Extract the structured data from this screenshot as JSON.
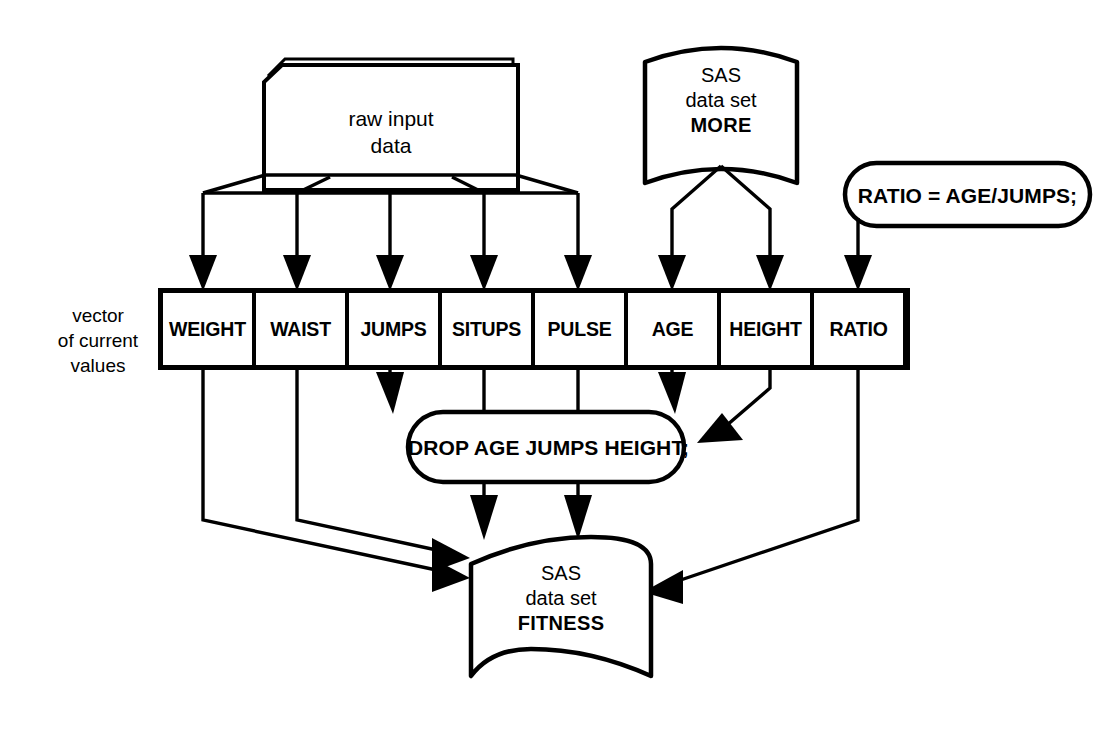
{
  "diagram": {
    "nodes": {
      "raw_input": {
        "name": "raw-input-data",
        "label_line1": "raw input",
        "label_line2": "data",
        "shape": "card-deck"
      },
      "dataset_more": {
        "name": "sas-data-set-more",
        "label_line1": "SAS",
        "label_line2": "data set",
        "label_line3": "MORE",
        "shape": "data-set"
      },
      "ratio_statement": {
        "name": "ratio-assignment-statement",
        "label": "RATIO = AGE/JUMPS;",
        "shape": "rounded-capsule"
      },
      "drop_statement": {
        "name": "drop-statement",
        "label": "DROP AGE JUMPS HEIGHT;",
        "shape": "rounded-capsule"
      },
      "dataset_fitness": {
        "name": "sas-data-set-fitness",
        "label_line1": "SAS",
        "label_line2": "data set",
        "label_line3": "FITNESS",
        "shape": "data-set"
      }
    },
    "vector": {
      "caption_line1": "vector",
      "caption_line2": "of current",
      "caption_line3": "values",
      "cells": [
        {
          "label": "WEIGHT"
        },
        {
          "label": "WAIST"
        },
        {
          "label": "JUMPS"
        },
        {
          "label": "SITUPS"
        },
        {
          "label": "PULSE"
        },
        {
          "label": "AGE"
        },
        {
          "label": "HEIGHT"
        },
        {
          "label": "RATIO"
        }
      ]
    },
    "colors": {
      "line": "#000000",
      "fill": "#ffffff",
      "text": "#000000"
    }
  }
}
